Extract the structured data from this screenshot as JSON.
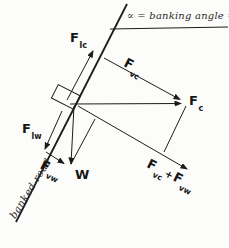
{
  "diagram": {
    "title": "∝ = banking angle = 64°",
    "road_label": "banked road",
    "vectors": {
      "flc": {
        "f": "F",
        "sub": "lc"
      },
      "fvc": {
        "f": "F",
        "sub": "vc"
      },
      "fc": {
        "f": "F",
        "sub": "c"
      },
      "flw": {
        "f": "F",
        "sub": "lw"
      },
      "fvw": {
        "f": "F",
        "sub": "vw"
      },
      "w": {
        "f": "W"
      },
      "normal_sum": {
        "f1": "F",
        "sub1": "vc",
        "plus": "+",
        "f2": "F",
        "sub2": "vw"
      }
    },
    "colors": {
      "ink": "#1c1c1c",
      "paper": "#fcfcfa"
    }
  }
}
